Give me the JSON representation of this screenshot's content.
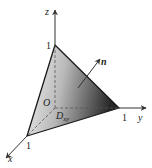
{
  "diagram": {
    "axes": {
      "x": {
        "label": "x",
        "tick": "1"
      },
      "y": {
        "label": "y",
        "tick": "1"
      },
      "z": {
        "label": "z",
        "tick": "1"
      }
    },
    "origin_label": "O",
    "normal_label": "n",
    "region_label_main": "D",
    "region_label_sub": "xy",
    "colors": {
      "surface_light": "#f2f2f2",
      "surface_dark": "#2a2a2a",
      "axis": "#333333",
      "background": "#ffffff"
    }
  }
}
